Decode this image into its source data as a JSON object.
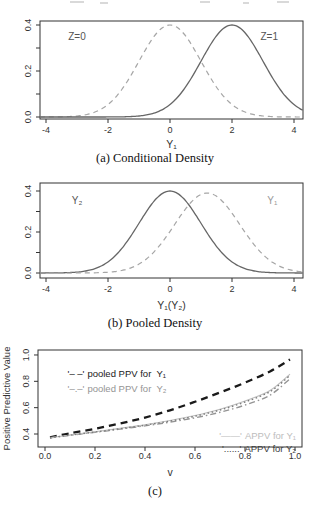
{
  "figure": {
    "description_visible_text_only": "Three stacked statistical plots",
    "accent_colors": {
      "dark_curve": "#666666",
      "light_dashed_curve": "#a6a6a6",
      "black_bold_dashed": "#1a1a1a",
      "gray_dashdot": "#949494",
      "light_gray_solid": "#bdbdbd",
      "gray_dotted": "#7d7d7d",
      "axis": "#333333"
    }
  },
  "chart_data": [
    {
      "id": "conditional-density",
      "type": "line",
      "caption": "(a) Conditional Density",
      "xlabel": "Y₁",
      "ylabel": "",
      "xlim": [
        -4.2,
        4.3
      ],
      "ylim": [
        0,
        0.42
      ],
      "grid": false,
      "x_ticks": {
        "values": [
          -4,
          -2,
          0,
          2,
          4
        ],
        "labels": [
          "-4",
          "-2",
          "0",
          "2",
          "4"
        ]
      },
      "y_ticks": {
        "values": [
          0,
          0.2,
          0.4
        ],
        "labels": [
          "0.0",
          "0.2",
          "0.4"
        ]
      },
      "y_minor_ticks": [
        0.1,
        0.3
      ],
      "series": [
        {
          "name": "Z=0",
          "curve": "gaussian",
          "mean": 0,
          "sd": 1,
          "peak": 0.4,
          "style": "dashed",
          "color": "#a6a6a6"
        },
        {
          "name": "Z=1",
          "curve": "gaussian",
          "mean": 2,
          "sd": 1,
          "peak": 0.4,
          "style": "solid",
          "color": "#666666"
        }
      ],
      "annotations": [
        {
          "text": "Z=0",
          "x": -3.0,
          "y": 0.335,
          "color": "#555555"
        },
        {
          "text": "Z=1",
          "x": 3.2,
          "y": 0.335,
          "color": "#555555"
        }
      ]
    },
    {
      "id": "pooled-density",
      "type": "line",
      "caption": "(b) Pooled Density",
      "xlabel": "Y₁(Y₂)",
      "ylabel": "",
      "xlim": [
        -4.2,
        4.3
      ],
      "ylim": [
        0,
        0.42
      ],
      "grid": false,
      "x_ticks": {
        "values": [
          -4,
          -2,
          0,
          2,
          4
        ],
        "labels": [
          "-4",
          "-2",
          "0",
          "2",
          "4"
        ]
      },
      "y_ticks": {
        "values": [
          0,
          0.2,
          0.4
        ],
        "labels": [
          "0.0",
          "0.2",
          "0.4"
        ]
      },
      "y_minor_ticks": [
        0.1,
        0.3
      ],
      "series": [
        {
          "name": "Y₂",
          "curve": "gaussian",
          "mean": 0,
          "sd": 1,
          "peak": 0.4,
          "style": "solid",
          "color": "#666666"
        },
        {
          "name": "Y₁",
          "curve": "gaussian",
          "mean": 1.2,
          "sd": 1.05,
          "peak": 0.39,
          "style": "dashed",
          "color": "#a6a6a6"
        }
      ],
      "annotations": [
        {
          "text": "Y₂",
          "x": -3.0,
          "y": 0.335,
          "color": "#555555"
        },
        {
          "text": "Y₁",
          "x": 3.3,
          "y": 0.335,
          "color": "#999999"
        }
      ]
    },
    {
      "id": "ppv-curves",
      "type": "line",
      "caption": "(c)",
      "xlabel": "v",
      "ylabel": "Positive Predictive Value",
      "xlim": [
        0,
        1.0
      ],
      "ylim": [
        0.3,
        1.04
      ],
      "grid": false,
      "x_ticks": {
        "values": [
          0,
          0.2,
          0.4,
          0.6,
          0.8,
          1.0
        ],
        "labels": [
          "0.0",
          "0.2",
          "0.4",
          "0.6",
          "0.8",
          "1.0"
        ]
      },
      "y_ticks": {
        "values": [
          0.4,
          0.6,
          0.8,
          1.0
        ],
        "labels": [
          "0.4",
          "0.6",
          "0.8",
          "1.0"
        ]
      },
      "y_minor_ticks": [],
      "series": [
        {
          "name": "pooled PPV for Y₁",
          "style": "dashed-bold",
          "color": "#1a1a1a",
          "x": [
            0.02,
            0.1,
            0.2,
            0.3,
            0.4,
            0.5,
            0.6,
            0.7,
            0.8,
            0.9,
            0.98
          ],
          "y": [
            0.375,
            0.405,
            0.44,
            0.48,
            0.525,
            0.58,
            0.645,
            0.715,
            0.79,
            0.875,
            0.965
          ]
        },
        {
          "name": "pooled PPV for Y₂",
          "style": "dashdot",
          "color": "#949494",
          "x": [
            0.02,
            0.1,
            0.2,
            0.3,
            0.4,
            0.5,
            0.6,
            0.7,
            0.8,
            0.9,
            0.98
          ],
          "y": [
            0.372,
            0.39,
            0.413,
            0.437,
            0.462,
            0.49,
            0.523,
            0.565,
            0.62,
            0.695,
            0.82
          ]
        },
        {
          "name": "APPV for Y₁",
          "style": "solid-thin",
          "color": "#bdbdbd",
          "x": [
            0.02,
            0.1,
            0.2,
            0.3,
            0.4,
            0.5,
            0.6,
            0.7,
            0.8,
            0.9,
            0.98
          ],
          "y": [
            0.372,
            0.392,
            0.417,
            0.443,
            0.47,
            0.502,
            0.54,
            0.588,
            0.65,
            0.73,
            0.855
          ]
        },
        {
          "name": "APPV for Y₂",
          "style": "dotted",
          "color": "#7d7d7d",
          "x": [
            0.02,
            0.1,
            0.2,
            0.3,
            0.4,
            0.5,
            0.6,
            0.7,
            0.8,
            0.9,
            0.98
          ],
          "y": [
            0.372,
            0.391,
            0.415,
            0.44,
            0.467,
            0.498,
            0.535,
            0.582,
            0.643,
            0.722,
            0.845
          ]
        }
      ],
      "legend": [
        {
          "symbol": "'– –'",
          "label": "pooled PPV for  Y₁",
          "color": "#1a1a1a"
        },
        {
          "symbol": "'–.–'",
          "label": "pooled PPV for  Y₂",
          "color": "#949494"
        },
        {
          "symbol": "'——'",
          "label": "APPV for Y₁",
          "color": "#bdbdbd"
        },
        {
          "symbol": "'......'",
          "label": "APPV for Y₂",
          "color": "#3c3c3c"
        }
      ],
      "annotations": []
    }
  ]
}
